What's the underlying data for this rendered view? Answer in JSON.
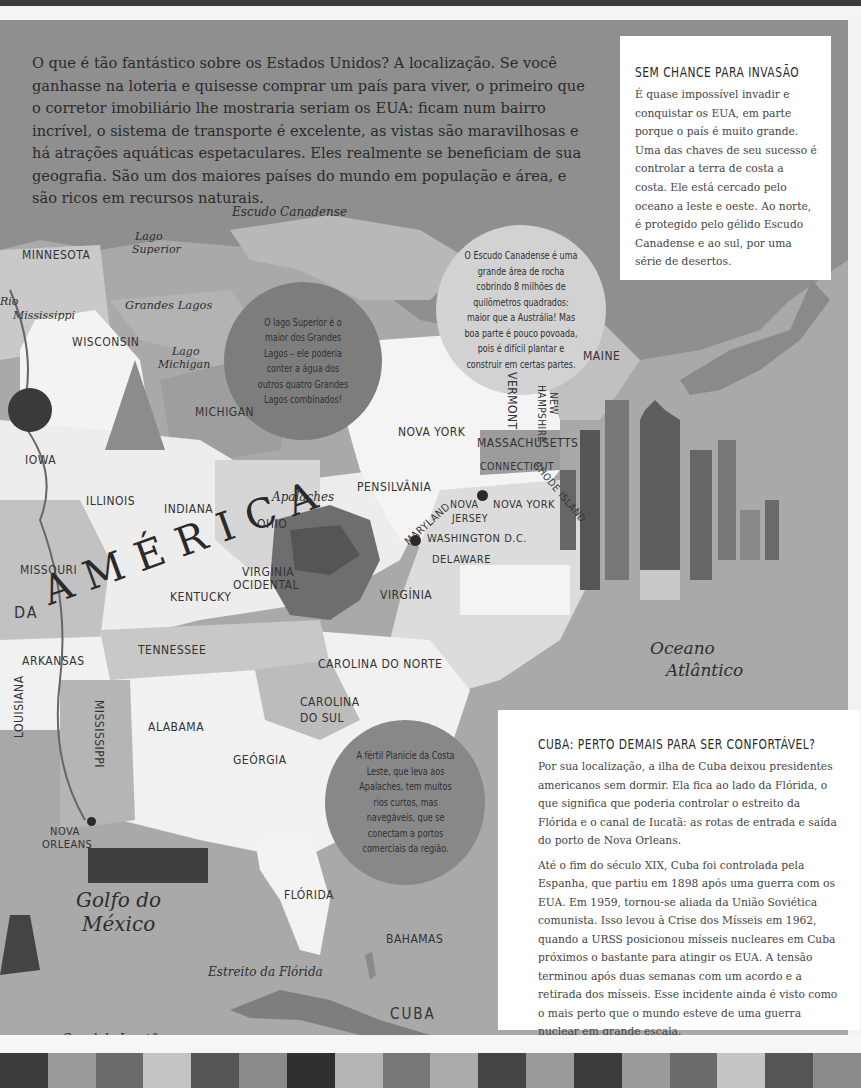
{
  "intro": {
    "text": "O que é tão fantástico sobre os Estados Unidos? A localização. Se você ganhasse na loteria e quisesse comprar um país para viver, o primeiro que o corretor imobiliário lhe mostraria seriam os EUA: ficam num bairro incrível, o sistema de transporte é excelente, as vistas são maravilhosas e há atrações aquáticas espetaculares. Eles realmente se beneficiam de sua geografia. São um dos maiores países do mundo em população e área, e são ricos em recursos naturais."
  },
  "sidebox_invasion": {
    "title": "SEM CHANCE PARA INVASÃO",
    "body": "É quase impossível invadir e conquistar os EUA, em parte porque o país é muito grande. Uma das chaves de seu sucesso é controlar a terra de costa a costa. Ele está cercado pelo oceano a leste e oeste. Ao norte, é protegido pelo gélido Escudo Canadense e ao sul, por uma série de desertos."
  },
  "sidebox_cuba": {
    "title": "CUBA: PERTO DEMAIS PARA SER CONFORTÁVEL?",
    "paragraphs": [
      "Por sua localização, a ilha de Cuba deixou presidentes americanos sem dormir. Ela fica ao lado da Flórida, o que significa que poderia controlar o estreito da Flórida e o canal de Iucatã: as rotas de entrada e saída do porto de Nova Orleans.",
      "Até o fim do século XIX, Cuba foi controlada pela Espanha, que partiu em 1898 após uma guerra com os EUA. Em 1959, tornou-se aliada da União Soviética comunista. Isso levou à Crise dos Mísseis em 1962, quando a URSS posicionou mísseis nucleares em Cuba próximos o bastante para atingir os EUA. A tensão terminou após duas semanas com um acordo e a retirada dos mísseis. Esse incidente ainda é visto como o mais perto que o mundo esteve de uma guerra nuclear em grande escala."
    ]
  },
  "bubbles": {
    "lake_superior": "O lago Superior é o maior dos Grandes Lagos – ele poderia conter a água dos outros quatro Grandes Lagos combinados!",
    "canadian_shield": "O Escudo Canadense é uma grande área de rocha cobrindo 8 milhões de quilômetros quadrados: maior que a Austrália! Mas boa parte é pouco povoada, pois é difícil plantar e construir em certas partes.",
    "coastal_plain": "A fértil Planície da Costa Leste, que leva aos Apalaches, tem muitos rios curtos, mas navegáveis, que se conectam a portos comerciais da região."
  },
  "map": {
    "title_word": "AMÉRICA",
    "title_prefix": "DA",
    "states": {
      "minnesota": "MINNESOTA",
      "wisconsin": "WISCONSIN",
      "michigan": "MICHIGAN",
      "iowa": "IOWA",
      "illinois": "ILLINOIS",
      "indiana": "INDIANA",
      "ohio": "OHIO",
      "missouri": "MISSOURI",
      "kentucky": "KENTUCKY",
      "west_virginia_1": "VIRGÍNIA",
      "west_virginia_2": "OCIDENTAL",
      "virginia": "VIRGÍNIA",
      "pennsylvania": "PENSILVÂNIA",
      "new_york_state": "NOVA YORK",
      "vermont": "VERMONT",
      "new_hampshire_1": "NEW",
      "new_hampshire_2": "HAMPSHIRE",
      "maine": "MAINE",
      "massachusetts": "MASSACHUSETTS",
      "connecticut": "CONNECTICUT",
      "rhode_island": "RHODE ISLAND",
      "new_jersey_1": "NOVA",
      "new_jersey_2": "JERSEY",
      "maryland": "MARYLAND",
      "delaware": "DELAWARE",
      "arkansas": "ARKANSAS",
      "tennessee": "TENNESSEE",
      "north_carolina": "CAROLINA DO NORTE",
      "south_carolina_1": "CAROLINA",
      "south_carolina_2": "DO SUL",
      "mississippi": "MISSISSIPPI",
      "alabama": "ALABAMA",
      "georgia": "GEÓRGIA",
      "louisiana": "LOUISIANA",
      "florida": "FLÓRIDA",
      "bahamas": "BAHAMAS",
      "cuba": "CUBA"
    },
    "cities": {
      "new_york_city": "NOVA YORK",
      "washington": "WASHINGTON D.C.",
      "new_orleans_1": "NOVA",
      "new_orleans_2": "ORLEANS"
    },
    "features": {
      "canadian_shield": "Escudo Canadense",
      "lake_superior_1": "Lago",
      "lake_superior_2": "Superior",
      "great_lakes": "Grandes Lagos",
      "lake_michigan_1": "Lago",
      "lake_michigan_2": "Michigan",
      "mississippi_river_1": "Rio",
      "mississippi_river_2": "Mississippi",
      "appalachians": "Apalaches",
      "atlantic_1": "Oceano",
      "atlantic_2": "Atlântico",
      "gulf_1": "Golfo do",
      "gulf_2": "México",
      "florida_strait": "Estreito da Flórida",
      "yucatan_channel": "Canal de Iucatã"
    }
  },
  "colors": {
    "sea": "#a9a9a9",
    "land_light": "#ececec",
    "land_mid": "#c4c4c4",
    "land_dark": "#8e8e8e",
    "bubble_dark": "#7d7d7d",
    "bubble_light": "#d2d2d2",
    "text": "#2b2b2b"
  }
}
